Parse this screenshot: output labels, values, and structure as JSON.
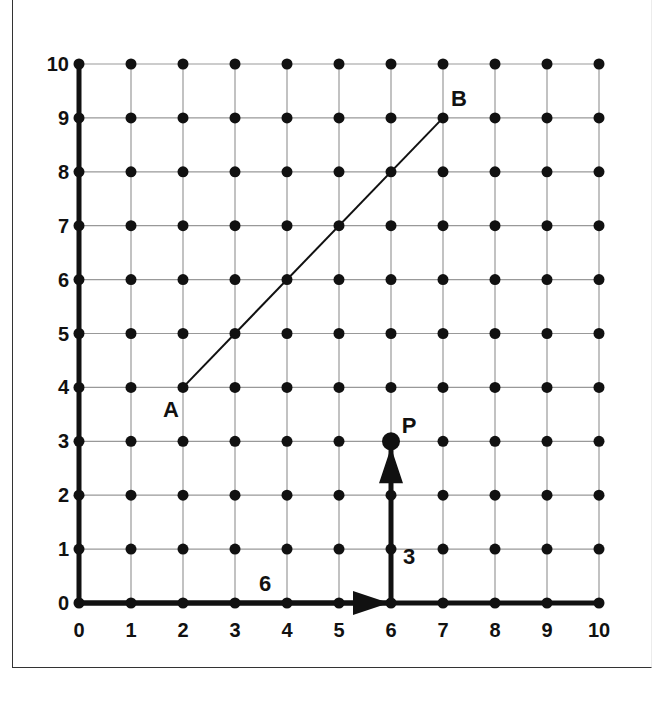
{
  "diagram": {
    "grid": {
      "xmin": 0,
      "xmax": 10,
      "ymin": 0,
      "ymax": 10,
      "step": 1
    },
    "x_ticks": [
      "0",
      "1",
      "2",
      "3",
      "4",
      "5",
      "6",
      "7",
      "8",
      "9",
      "10"
    ],
    "y_ticks": [
      "0",
      "1",
      "2",
      "3",
      "4",
      "5",
      "6",
      "7",
      "8",
      "9",
      "10"
    ],
    "points": [
      {
        "label": "A",
        "x": 2,
        "y": 4
      },
      {
        "label": "B",
        "x": 7,
        "y": 9
      },
      {
        "label": "P",
        "x": 6,
        "y": 3
      }
    ],
    "segment": {
      "from": "A",
      "to": "B"
    },
    "vectors": [
      {
        "label": "6",
        "from": [
          0,
          0
        ],
        "to": [
          6,
          0
        ],
        "direction": "right"
      },
      {
        "label": "3",
        "from": [
          6,
          0
        ],
        "to": [
          6,
          3
        ],
        "direction": "up"
      }
    ],
    "colors": {
      "ink": "#111111",
      "grid": "#999999",
      "background": "#ffffff"
    }
  }
}
